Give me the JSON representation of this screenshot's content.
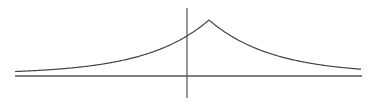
{
  "chart_data": {
    "type": "line",
    "title": "",
    "xlabel": "",
    "ylabel": "",
    "function": "y = exp(-|x - a|)",
    "peak_x": 1,
    "peak_y": 1,
    "xlim": [
      -7.7,
      7.7
    ],
    "ylim": [
      0,
      1
    ],
    "grid": false,
    "legend": false,
    "x": [
      -7,
      -6,
      -5,
      -4,
      -3,
      -2,
      -1,
      0,
      1,
      2,
      3,
      4,
      5,
      6,
      7
    ],
    "values": [
      0.0003,
      0.0009,
      0.0025,
      0.0067,
      0.0183,
      0.0498,
      0.1353,
      0.3679,
      1.0,
      0.3679,
      0.1353,
      0.0498,
      0.0183,
      0.0067,
      0.0025
    ],
    "colors": {
      "axis": "#555555",
      "curve": "#444444",
      "background": "#ffffff"
    }
  }
}
